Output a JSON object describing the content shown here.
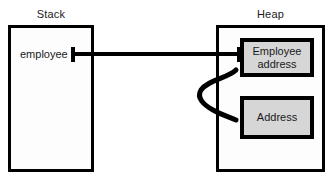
{
  "diagram": {
    "regions": [
      {
        "key": "stack",
        "label": "Stack"
      },
      {
        "key": "heap",
        "label": "Heap"
      }
    ],
    "stack": {
      "label": "Stack",
      "variable": "employee"
    },
    "heap": {
      "label": "Heap",
      "objects": [
        {
          "key": "employee-address",
          "label": "Employee\naddress"
        },
        {
          "key": "address",
          "label": "Address"
        }
      ]
    },
    "connectors": [
      {
        "key": "employee-to-employee-address",
        "from": "stack.variable.employee",
        "to": "heap.object.employee-address",
        "style": "straight-line"
      },
      {
        "key": "employee-address-to-address",
        "from": "heap.object.employee-address",
        "to": "heap.object.address",
        "style": "curved-hook"
      }
    ],
    "colors": {
      "background": "#ffffff",
      "region_fill": "#fdfdfd",
      "object_fill": "#d6d6d6",
      "stroke": "#000000",
      "text": "#1a1a1a"
    }
  }
}
